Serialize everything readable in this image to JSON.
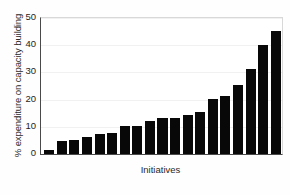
{
  "chart_data": {
    "type": "bar",
    "title": "",
    "xlabel": "Initiatives",
    "ylabel": "% expenditure on capacity building",
    "ylim": [
      0,
      50
    ],
    "yticks": [
      0,
      10,
      20,
      30,
      40,
      50
    ],
    "ytick_labels": [
      "0",
      "10",
      "20",
      "30",
      "40",
      "50"
    ],
    "grid": true,
    "legend": "none",
    "categories": [
      "1",
      "2",
      "3",
      "4",
      "5",
      "6",
      "7",
      "8",
      "9",
      "10",
      "11",
      "12",
      "13",
      "14",
      "15",
      "16",
      "17",
      "18",
      "19"
    ],
    "values": [
      1.5,
      4.8,
      5.1,
      6.2,
      7.2,
      7.7,
      10.3,
      10.3,
      12.2,
      13.2,
      13.2,
      14.2,
      15.3,
      20.2,
      21.2,
      25.3,
      31.2,
      40.2,
      45.2
    ],
    "bar_color": "#080808",
    "background_color": "#ffffff",
    "gridline_color": "#f1f1f1",
    "axis_color": "#4a4a4a"
  }
}
